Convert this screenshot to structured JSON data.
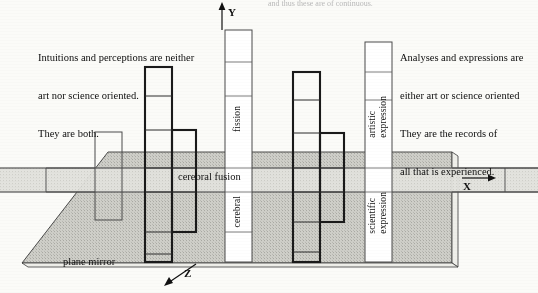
{
  "figure": {
    "title_cut": "and thus these are of continuous.",
    "axes": {
      "y": "Y",
      "x": "X",
      "z": "Z"
    },
    "plane_label": "plane mirror",
    "band_label": "cerebral fusion",
    "notes": {
      "left": [
        "Intuitions and perceptions are neither",
        "art nor science oriented.",
        "They are both."
      ],
      "right": [
        "Analyses and expressions are",
        "either art or science oriented",
        "They are the records of",
        "all that is experienced."
      ]
    },
    "columns": [
      {
        "id": "col-left-thin",
        "label": "",
        "style": "thin-outline"
      },
      {
        "id": "col-bold-left",
        "label": "",
        "style": "bold-step"
      },
      {
        "id": "col-fission",
        "label": "fission",
        "sublabel": "cerebral",
        "style": "thin-tall"
      },
      {
        "id": "col-bold-right",
        "label": "",
        "style": "bold-step"
      },
      {
        "id": "col-expression",
        "label": "artistic\nexpression",
        "sublabel": "scientific\nexpression",
        "style": "thin-tall"
      }
    ],
    "vertical_labels": {
      "fission": "fission",
      "cerebral": "cerebral",
      "artistic_expression": "artistic\nexpression",
      "scientific_expression": "scientific\nexpression"
    },
    "colors": {
      "ink": "#111111",
      "mirror_fill": "#c9c9c4",
      "band_fill": "#dcdcd7",
      "paper": "#fbfbf8",
      "grid": "#6e6e6e"
    }
  }
}
